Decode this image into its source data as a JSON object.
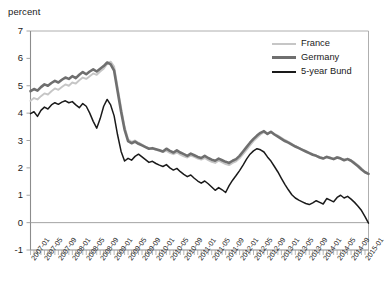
{
  "chart_data": {
    "type": "line",
    "title": "",
    "ylabel": "percent",
    "xlabel": "",
    "ylim": [
      -1,
      7
    ],
    "yticks": [
      -1,
      0,
      1,
      2,
      3,
      4,
      5,
      6,
      7
    ],
    "grid": false,
    "legend_position": "top-right",
    "legend": [
      "France",
      "Germany",
      "5-year Bund"
    ],
    "colors": {
      "France": "#c6c6c6",
      "Germany": "#6f6f6f",
      "5-year Bund": "#1a1a1a",
      "axis": "#9a9a9a",
      "text": "#1a1a1a"
    },
    "xtick_labels": [
      "2007-01",
      "2007-05",
      "2007-09",
      "2008-01",
      "2008-05",
      "2008-09",
      "2009-01",
      "2009-05",
      "2009-09",
      "2010-01",
      "2010-05",
      "2010-09",
      "2011-01",
      "2011-05",
      "2011-09",
      "2012-01",
      "2012-05",
      "2012-09",
      "2013-01",
      "2013-05",
      "2013-09",
      "2014-01",
      "2014-05",
      "2014-09",
      "2015-01"
    ],
    "x_start": "2007-01",
    "x_end": "2015-02",
    "x_tick_interval_months": 4,
    "n_points": 98,
    "series": [
      {
        "name": "France",
        "color": "#c6c6c6",
        "width": 1.9,
        "values": [
          4.45,
          4.55,
          4.5,
          4.62,
          4.72,
          4.68,
          4.8,
          4.9,
          4.85,
          4.95,
          5.05,
          5.0,
          5.12,
          5.08,
          5.2,
          5.3,
          5.25,
          5.35,
          5.45,
          5.4,
          5.52,
          5.62,
          5.8,
          5.88,
          5.7,
          4.95,
          4.2,
          3.5,
          3.05,
          2.95,
          3.0,
          2.92,
          2.85,
          2.78,
          2.72,
          2.7,
          2.66,
          2.62,
          2.58,
          2.62,
          2.55,
          2.5,
          2.56,
          2.48,
          2.42,
          2.38,
          2.45,
          2.4,
          2.34,
          2.3,
          2.36,
          2.28,
          2.22,
          2.18,
          2.26,
          2.2,
          2.14,
          2.1,
          2.18,
          2.24,
          2.35,
          2.5,
          2.66,
          2.82,
          2.98,
          3.1,
          3.22,
          3.3,
          3.25,
          3.3,
          3.24,
          3.18,
          3.1,
          3.02,
          2.95,
          2.88,
          2.8,
          2.74,
          2.68,
          2.62,
          2.56,
          2.5,
          2.45,
          2.4,
          2.36,
          2.42,
          2.38,
          2.34,
          2.4,
          2.36,
          2.3,
          2.34,
          2.28,
          2.2,
          2.1,
          1.98,
          1.86,
          1.8
        ]
      },
      {
        "name": "Germany",
        "color": "#6f6f6f",
        "width": 2.6,
        "values": [
          4.8,
          4.88,
          4.82,
          4.95,
          5.05,
          5.0,
          5.1,
          5.18,
          5.12,
          5.22,
          5.3,
          5.25,
          5.35,
          5.28,
          5.4,
          5.5,
          5.42,
          5.52,
          5.6,
          5.52,
          5.62,
          5.72,
          5.85,
          5.78,
          5.55,
          4.8,
          4.05,
          3.4,
          2.98,
          2.9,
          2.96,
          2.88,
          2.82,
          2.76,
          2.7,
          2.72,
          2.68,
          2.64,
          2.6,
          2.7,
          2.62,
          2.56,
          2.64,
          2.56,
          2.5,
          2.44,
          2.52,
          2.46,
          2.4,
          2.36,
          2.44,
          2.36,
          2.3,
          2.26,
          2.34,
          2.28,
          2.22,
          2.18,
          2.26,
          2.32,
          2.44,
          2.6,
          2.76,
          2.92,
          3.06,
          3.18,
          3.28,
          3.34,
          3.24,
          3.32,
          3.22,
          3.14,
          3.06,
          2.98,
          2.92,
          2.85,
          2.78,
          2.72,
          2.66,
          2.6,
          2.54,
          2.48,
          2.44,
          2.38,
          2.34,
          2.4,
          2.36,
          2.32,
          2.38,
          2.34,
          2.28,
          2.32,
          2.26,
          2.16,
          2.06,
          1.94,
          1.84,
          1.78
        ]
      },
      {
        "name": "5-year Bund",
        "color": "#1a1a1a",
        "width": 1.5,
        "values": [
          3.98,
          4.05,
          3.88,
          4.1,
          4.22,
          4.15,
          4.3,
          4.38,
          4.32,
          4.4,
          4.45,
          4.38,
          4.42,
          4.3,
          4.2,
          4.35,
          4.25,
          4.0,
          3.7,
          3.45,
          3.8,
          4.25,
          4.5,
          4.3,
          3.9,
          3.2,
          2.6,
          2.25,
          2.35,
          2.28,
          2.42,
          2.5,
          2.4,
          2.3,
          2.2,
          2.24,
          2.16,
          2.1,
          2.05,
          2.12,
          2.0,
          1.92,
          1.98,
          1.86,
          1.76,
          1.68,
          1.74,
          1.62,
          1.52,
          1.44,
          1.52,
          1.42,
          1.3,
          1.18,
          1.28,
          1.2,
          1.1,
          1.35,
          1.55,
          1.72,
          1.9,
          2.1,
          2.32,
          2.5,
          2.62,
          2.7,
          2.66,
          2.58,
          2.4,
          2.25,
          2.05,
          1.85,
          1.62,
          1.4,
          1.2,
          1.02,
          0.9,
          0.82,
          0.76,
          0.7,
          0.66,
          0.72,
          0.8,
          0.74,
          0.68,
          0.88,
          0.82,
          0.76,
          0.92,
          1.0,
          0.9,
          0.96,
          0.86,
          0.74,
          0.6,
          0.44,
          0.22,
          -0.02
        ]
      }
    ]
  },
  "axis": {
    "unit_label": "percent",
    "y_labels": [
      "7",
      "6",
      "5",
      "4",
      "3",
      "2",
      "1",
      "0",
      "-1"
    ]
  },
  "legend_items": [
    {
      "label": "France",
      "key": "france"
    },
    {
      "label": "Germany",
      "key": "germany"
    },
    {
      "label": "5-year Bund",
      "key": "bund"
    }
  ]
}
